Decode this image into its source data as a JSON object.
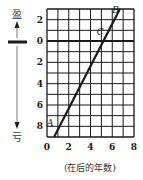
{
  "chart_data": {
    "type": "line",
    "title": "",
    "xlabel": "(在后的年数)",
    "ylabel_top": "盈",
    "ylabel_bottom": "亏",
    "xlim": [
      0,
      8
    ],
    "ylim": [
      -9,
      3
    ],
    "grid": true,
    "x_ticks": [
      0,
      2,
      4,
      6,
      8
    ],
    "x_tick_labels": [
      "0",
      "2",
      "4",
      "6",
      "8"
    ],
    "y_ticks": [
      2,
      0,
      -2,
      -4,
      -6,
      -8
    ],
    "y_tick_labels": [
      "2",
      "0",
      "2",
      "4",
      "6",
      "8"
    ],
    "series": [
      {
        "name": "profit-loss",
        "x": [
          0.65,
          6.7
        ],
        "y": [
          -9,
          3
        ]
      }
    ],
    "annotations": [
      {
        "label": "A",
        "x": 0.3,
        "y": -8
      },
      {
        "label": "B",
        "x": 6.3,
        "y": 2.6
      },
      {
        "label": "C",
        "x": 4.9,
        "y": 0.6
      }
    ],
    "colors": {
      "line": "#1a1a1a",
      "grid": "#1a1a1a"
    }
  }
}
